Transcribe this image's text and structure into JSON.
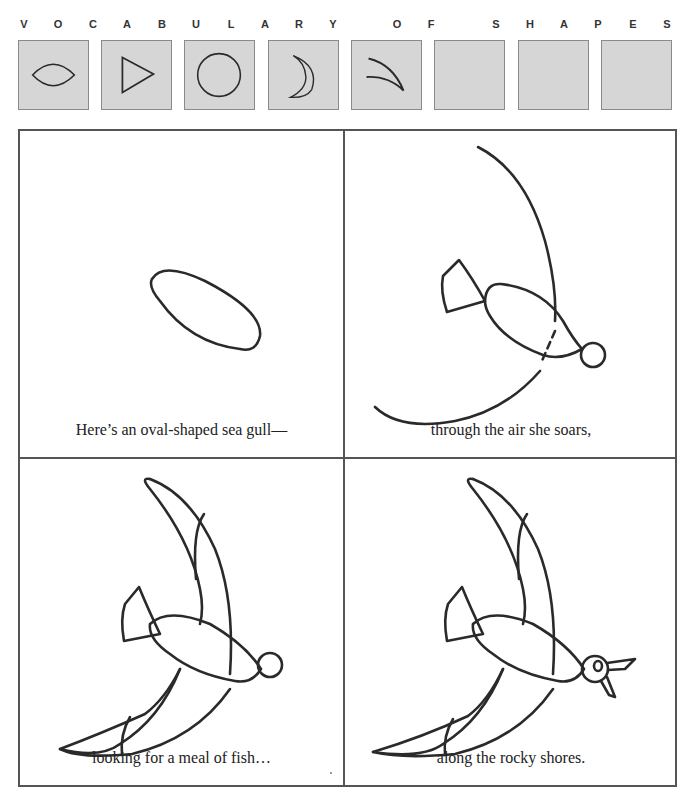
{
  "heading": {
    "letters": [
      {
        "ch": "V",
        "x": 24
      },
      {
        "ch": "O",
        "x": 58
      },
      {
        "ch": "C",
        "x": 93
      },
      {
        "ch": "A",
        "x": 127
      },
      {
        "ch": "B",
        "x": 162
      },
      {
        "ch": "U",
        "x": 196
      },
      {
        "ch": "L",
        "x": 231
      },
      {
        "ch": "A",
        "x": 265
      },
      {
        "ch": "R",
        "x": 299
      },
      {
        "ch": "Y",
        "x": 333
      },
      {
        "ch": "O",
        "x": 397
      },
      {
        "ch": "F",
        "x": 431
      },
      {
        "ch": "S",
        "x": 496
      },
      {
        "ch": "H",
        "x": 530
      },
      {
        "ch": "A",
        "x": 564
      },
      {
        "ch": "P",
        "x": 598
      },
      {
        "ch": "E",
        "x": 633
      },
      {
        "ch": "S",
        "x": 667
      }
    ],
    "text": "VOCABULARY OF SHAPES"
  },
  "vocabulary": [
    {
      "shape": "oval-icon",
      "label": "oval"
    },
    {
      "shape": "triangle-icon",
      "label": "triangle"
    },
    {
      "shape": "circle-icon",
      "label": "circle"
    },
    {
      "shape": "crescent-icon",
      "label": "crescent"
    },
    {
      "shape": "thin-crescent-icon",
      "label": "thin crescent"
    },
    {
      "shape": "empty",
      "label": ""
    },
    {
      "shape": "empty",
      "label": ""
    },
    {
      "shape": "empty",
      "label": ""
    }
  ],
  "panels": [
    {
      "step": 1,
      "caption": "Here’s an oval-shaped sea gull—"
    },
    {
      "step": 2,
      "caption": "through the air she soars,"
    },
    {
      "step": 3,
      "caption": "looking for a meal of fish…"
    },
    {
      "step": 4,
      "caption": "along the rocky shores."
    }
  ],
  "colors": {
    "box_fill": "#d6d6d6",
    "line": "#2a2a2a",
    "border": "#555555"
  }
}
